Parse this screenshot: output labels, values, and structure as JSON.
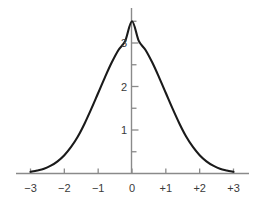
{
  "chart_data": {
    "type": "line",
    "title": "",
    "subtitle": "",
    "xlabel": "",
    "ylabel": "",
    "grid": false,
    "legend": "none",
    "xlim": [
      -3,
      3
    ],
    "ylim": [
      0,
      3.9
    ],
    "x_ticks": [
      {
        "value": -3,
        "label": "−3"
      },
      {
        "value": -2,
        "label": "−2"
      },
      {
        "value": -1,
        "label": "−1"
      },
      {
        "value": 0,
        "label": "0"
      },
      {
        "value": 1,
        "label": "+1"
      },
      {
        "value": 2,
        "label": "+2"
      },
      {
        "value": 3,
        "label": "+3"
      }
    ],
    "y_ticks": [
      {
        "value": 1,
        "label": "1"
      },
      {
        "value": 2,
        "label": "2"
      },
      {
        "value": 3,
        "label": "3"
      }
    ],
    "y_minor_ticks": [
      0.5,
      1.5,
      2.5,
      3.5
    ],
    "series": [
      {
        "name": "bell-curve",
        "color": "#1a1a1a",
        "x": [
          -3.0,
          -2.8,
          -2.6,
          -2.4,
          -2.2,
          -2.0,
          -1.8,
          -1.6,
          -1.4,
          -1.2,
          -1.0,
          -0.8,
          -0.6,
          -0.4,
          -0.2,
          0.0,
          0.2,
          0.4,
          0.6,
          0.8,
          1.0,
          1.2,
          1.4,
          1.6,
          1.8,
          2.0,
          2.2,
          2.4,
          2.6,
          2.8,
          3.0
        ],
        "y": [
          0.04,
          0.07,
          0.11,
          0.18,
          0.28,
          0.42,
          0.61,
          0.85,
          1.15,
          1.49,
          1.85,
          2.21,
          2.55,
          2.84,
          3.05,
          3.5,
          3.05,
          2.84,
          2.55,
          2.21,
          1.85,
          1.49,
          1.15,
          0.85,
          0.61,
          0.42,
          0.28,
          0.18,
          0.11,
          0.07,
          0.04
        ]
      }
    ],
    "colors": {
      "curve": "#1a1a1a",
      "axis": "#8a8a8a",
      "tick_label": "#3a3a3a",
      "background": "#ffffff"
    }
  }
}
